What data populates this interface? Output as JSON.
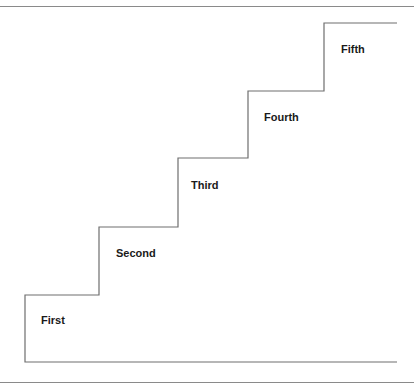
{
  "diagram": {
    "type": "staircase",
    "line_color": "#6e6e6e",
    "steps": [
      {
        "label": "First",
        "x": 25,
        "top": 295,
        "right": 99,
        "label_x": 41,
        "label_y": 321
      },
      {
        "label": "Second",
        "x": 99,
        "top": 227,
        "right": 178,
        "label_x": 116,
        "label_y": 254
      },
      {
        "label": "Third",
        "x": 178,
        "top": 158,
        "right": 248,
        "label_x": 191,
        "label_y": 186
      },
      {
        "label": "Fourth",
        "x": 248,
        "top": 91,
        "right": 324,
        "label_x": 264,
        "label_y": 118
      },
      {
        "label": "Fifth",
        "x": 324,
        "top": 23,
        "right": 397,
        "label_x": 341,
        "label_y": 50
      }
    ],
    "baseline_y": 362,
    "baseline_right": 397
  }
}
